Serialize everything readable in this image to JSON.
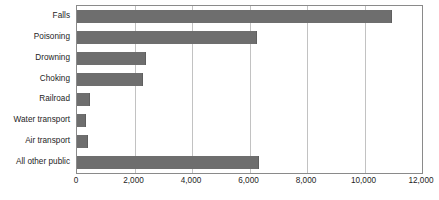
{
  "chart_data": {
    "type": "bar",
    "orientation": "horizontal",
    "title": "",
    "xlabel": "",
    "ylabel": "",
    "xlim": [
      0,
      12000
    ],
    "grid": true,
    "legend": false,
    "categories": [
      "Falls",
      "Poisoning",
      "Drowning",
      "Choking",
      "Railroad",
      "Water transport",
      "Air transport",
      "All other public"
    ],
    "values": [
      10950,
      6250,
      2400,
      2300,
      450,
      330,
      370,
      6330
    ],
    "xticks": [
      0,
      2000,
      4000,
      6000,
      8000,
      10000,
      12000
    ],
    "xticklabels": [
      "0",
      "2,000",
      "4,000",
      "6,000",
      "8,000",
      "10,000",
      "12,000"
    ],
    "series": [
      {
        "name": "Deaths",
        "values": [
          10950,
          6250,
          2400,
          2300,
          450,
          330,
          370,
          6330
        ]
      }
    ],
    "colors": {
      "bar": "#6e6e6e",
      "gridline": "#c2c2c2",
      "axis": "#8a8a8a",
      "text": "#1d1d1d",
      "background": "#ffffff"
    }
  }
}
